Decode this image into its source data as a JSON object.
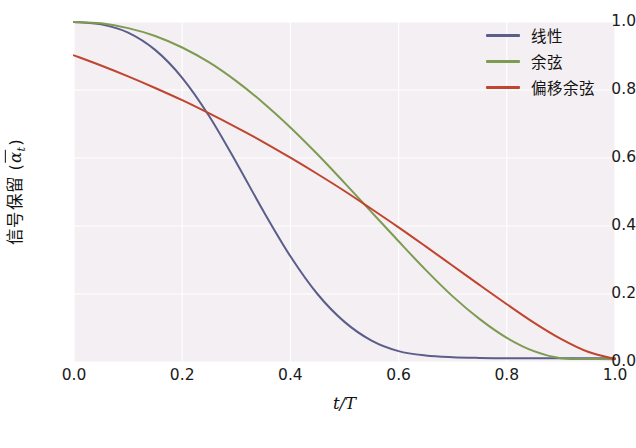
{
  "chart_data": {
    "type": "line",
    "title": "",
    "xlabel": "t/T",
    "ylabel_text": "信号保留 (",
    "ylabel_symbol": "α",
    "ylabel_symbol_sub": "t",
    "ylabel_suffix": ")",
    "xlim": [
      0.0,
      1.0
    ],
    "ylim": [
      0.0,
      1.0
    ],
    "grid": true,
    "legend_position": "upper right",
    "background": "#f4eff2",
    "gridline_color": "#ffffff",
    "xticks": [
      "0.0",
      "0.2",
      "0.4",
      "0.6",
      "0.8",
      "1.0"
    ],
    "xtick_values": [
      0.0,
      0.2,
      0.4,
      0.6,
      0.8,
      1.0
    ],
    "yticks": [
      "0.0",
      "0.2",
      "0.4",
      "0.6",
      "0.8",
      "1.0"
    ],
    "ytick_values": [
      0.0,
      0.2,
      0.4,
      0.6,
      0.8,
      1.0
    ],
    "x": [
      0.0,
      0.05,
      0.1,
      0.15,
      0.2,
      0.25,
      0.3,
      0.35,
      0.4,
      0.45,
      0.5,
      0.55,
      0.6,
      0.65,
      0.7,
      0.75,
      0.8,
      0.85,
      0.9,
      0.95,
      1.0
    ],
    "series": [
      {
        "name": "线性",
        "color": "#5b5d8a",
        "linewidth": 2.0,
        "values": [
          1.0,
          0.993,
          0.969,
          0.918,
          0.836,
          0.723,
          0.587,
          0.444,
          0.311,
          0.2,
          0.118,
          0.063,
          0.032,
          0.019,
          0.014,
          0.012,
          0.011,
          0.011,
          0.011,
          0.011,
          0.011
        ]
      },
      {
        "name": "余弦",
        "color": "#7d9b52",
        "linewidth": 2.0,
        "values": [
          1.0,
          0.996,
          0.982,
          0.959,
          0.925,
          0.881,
          0.826,
          0.762,
          0.69,
          0.611,
          0.527,
          0.441,
          0.355,
          0.271,
          0.193,
          0.126,
          0.071,
          0.032,
          0.011,
          0.009,
          0.008
        ]
      },
      {
        "name": "偏移余弦",
        "color": "#c0452f",
        "linewidth": 2.0,
        "values": [
          0.902,
          0.872,
          0.84,
          0.806,
          0.77,
          0.731,
          0.69,
          0.647,
          0.601,
          0.553,
          0.503,
          0.45,
          0.396,
          0.34,
          0.283,
          0.226,
          0.17,
          0.116,
          0.068,
          0.03,
          0.009
        ]
      }
    ]
  },
  "legend": {
    "items": [
      {
        "label": "线性",
        "color": "#5b5d8a"
      },
      {
        "label": "余弦",
        "color": "#7d9b52"
      },
      {
        "label": "偏移余弦",
        "color": "#c0452f"
      }
    ]
  }
}
